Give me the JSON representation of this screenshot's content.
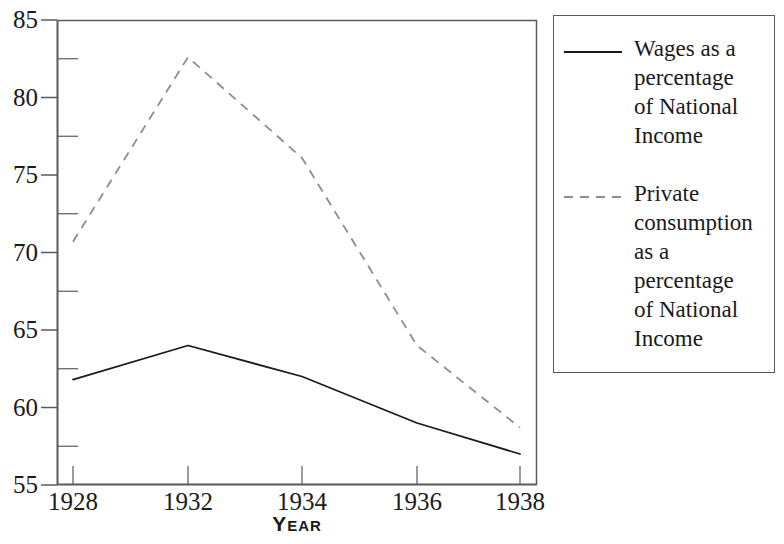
{
  "chart_data": {
    "type": "line",
    "title": "",
    "subtitle": "",
    "xlabel": "Year",
    "ylabel": "",
    "x": [
      1928,
      1932,
      1934,
      1936,
      1938
    ],
    "categories": [
      "1928",
      "1932",
      "1934",
      "1936",
      "1938"
    ],
    "xtick_labels": [
      "1928",
      "1932",
      "1934",
      "1936",
      "1938"
    ],
    "ytick_labels": [
      "85",
      "80",
      "75",
      "70",
      "65",
      "60",
      "55"
    ],
    "yticks": [
      85,
      80,
      75,
      70,
      65,
      60,
      55
    ],
    "yminor_ticks": [
      82.5,
      77.5,
      72.5,
      67.5,
      62.5,
      57.5
    ],
    "ylim": [
      55,
      85
    ],
    "xlim": [
      1928,
      1938
    ],
    "grid": false,
    "legend_position": "right",
    "series": [
      {
        "name": "Wages as a\npercentage\nof National\nIncome",
        "style": "solid",
        "color": "#1a1a1a",
        "values": [
          61.8,
          64.0,
          62.0,
          59.0,
          57.0
        ]
      },
      {
        "name": "Private\nconsumption\nas a\npercentage\nof National\nIncome",
        "style": "dashed",
        "color": "#8c8c96",
        "values": [
          70.7,
          82.6,
          76.1,
          64.0,
          58.7
        ]
      }
    ]
  },
  "axis": {
    "x_title": "Year",
    "y_tick_0": "85",
    "y_tick_1": "80",
    "y_tick_2": "75",
    "y_tick_3": "70",
    "y_tick_4": "65",
    "y_tick_5": "60",
    "y_tick_6": "55",
    "x_tick_0": "1928",
    "x_tick_1": "1932",
    "x_tick_2": "1934",
    "x_tick_3": "1936",
    "x_tick_4": "1938"
  },
  "legend": {
    "items": [
      {
        "label": "Wages as a\npercentage\nof National\nIncome",
        "style": "solid",
        "color": "#1a1a1a"
      },
      {
        "label": "Private\nconsumption\nas a\npercentage\nof National\nIncome",
        "style": "dashed",
        "color": "#8c8c96"
      }
    ]
  },
  "colors": {
    "axis": "#5a5a5a",
    "solid_series": "#1a1a1a",
    "dashed_series": "#8c8c96",
    "text": "#1a1a1a",
    "background": "#ffffff"
  }
}
